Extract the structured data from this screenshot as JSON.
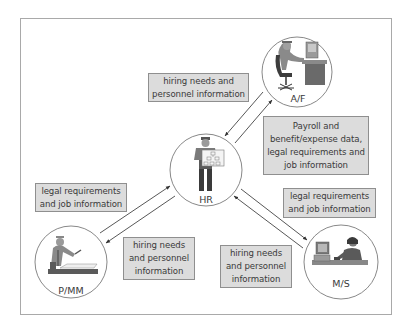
{
  "diagram": {
    "type": "information-flow",
    "frame_color": "#a9a9a9",
    "box_fill": "#dcdcdc",
    "box_border": "#8f8f8f",
    "arrow_color": "#333333",
    "nodes": [
      {
        "id": "hr",
        "label": "HR",
        "icon": "person-presenting-org-chart-icon"
      },
      {
        "id": "af",
        "label": "A/F",
        "icon": "person-at-computer-desk-icon"
      },
      {
        "id": "pmm",
        "label": "P/MM",
        "icon": "worker-inspecting-blueprint-icon"
      },
      {
        "id": "ms",
        "label": "M/S",
        "icon": "person-on-phone-at-computer-icon"
      }
    ],
    "flows": [
      {
        "from": "af",
        "to": "hr",
        "label": "hiring needs and personnel information"
      },
      {
        "from": "hr",
        "to": "af",
        "label": "Payroll and benefit/expense data, legal requirements and job information"
      },
      {
        "from": "pmm",
        "to": "hr",
        "label": "legal requirements and job information"
      },
      {
        "from": "hr",
        "to": "pmm",
        "label": "hiring needs and personnel information"
      },
      {
        "from": "hr",
        "to": "ms",
        "label": "legal requirements and job information"
      },
      {
        "from": "ms",
        "to": "hr",
        "label": "hiring needs and personnel information"
      }
    ]
  },
  "labels": {
    "af_hr_top": "hiring needs and personnel information",
    "hr_af_payroll": "Payroll and benefit/expense data, legal requirements and job information",
    "pmm_hr_legal": "legal requirements and job information",
    "hr_pmm_hiring": "hiring needs and personnel information",
    "hr_ms_legal": "legal requirements and job information",
    "ms_hr_hiring": "hiring needs and personnel information"
  },
  "nodes": {
    "hr": "HR",
    "af": "A/F",
    "pmm": "P/MM",
    "ms": "M/S"
  }
}
